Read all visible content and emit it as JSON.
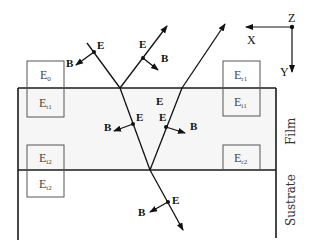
{
  "diagram": {
    "layers": {
      "film_label": "Film",
      "substrate_label": "Sustrate"
    },
    "axes": {
      "x_label": "X",
      "y_label": "Y",
      "z_label": "Z"
    },
    "field_labels": {
      "electric": "E",
      "magnetic": "B"
    },
    "boxes": [
      {
        "id": "E0",
        "base": "E",
        "sub": "0"
      },
      {
        "id": "Et1",
        "base": "E",
        "sub": "t1"
      },
      {
        "id": "Er1",
        "base": "E",
        "sub": "r1"
      },
      {
        "id": "Ei1",
        "base": "E",
        "sub": "i1"
      },
      {
        "id": "Ei2",
        "base": "E",
        "sub": "i2"
      },
      {
        "id": "Et2",
        "base": "E",
        "sub": "t2"
      },
      {
        "id": "Er2",
        "base": "E",
        "sub": "r2"
      }
    ],
    "colors": {
      "line": "#1a1a1a",
      "film_fill": "#f6f6f6",
      "box_stroke": "#555555"
    }
  }
}
